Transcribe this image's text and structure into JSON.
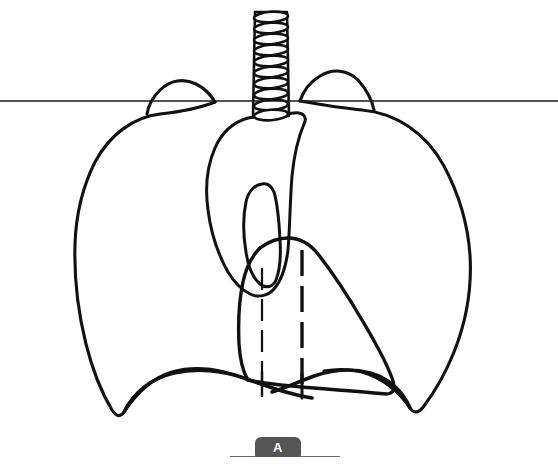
{
  "figure": {
    "panel_label": "A",
    "background_color": "#ffffff",
    "line_color": "#111111",
    "label_tab_color": "#555555",
    "label_text_color": "#ffffff",
    "baseline_color": "#6b6b6b"
  },
  "structures": [
    {
      "id": "trachea",
      "name": "Trachea with cartilage rings",
      "ring_count": 10
    },
    {
      "id": "right-lung",
      "name": "Right lung (viewer left)"
    },
    {
      "id": "left-lung",
      "name": "Left lung (viewer right)"
    },
    {
      "id": "mediastinum",
      "name": "Mediastinal / aortic silhouette"
    },
    {
      "id": "aortic-arch",
      "name": "Aortic arch loop"
    },
    {
      "id": "heart",
      "name": "Heart silhouette"
    },
    {
      "id": "diaphragm",
      "name": "Diaphragm domes"
    },
    {
      "id": "descending-aorta",
      "name": "Descending aorta (dashed)"
    },
    {
      "id": "esophagus",
      "name": "Esophagus / paraspinal line (dashed)"
    },
    {
      "id": "reference-line",
      "name": "Horizontal reference line"
    }
  ],
  "reference_line": {
    "y": 101,
    "x_start": 0,
    "x_end": 558
  },
  "label": {
    "text": "A",
    "tab_left": 255,
    "tab_top": 437,
    "tab_width": 46,
    "tab_height": 20,
    "baseline_left": 230,
    "baseline_top": 456,
    "baseline_width": 110
  }
}
